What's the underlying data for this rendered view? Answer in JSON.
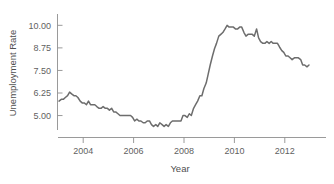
{
  "chart_data": {
    "type": "line",
    "title": "",
    "xlabel": "Year",
    "ylabel": "Unemployment Rate",
    "xlim": [
      2003.0,
      2013.0
    ],
    "ylim": [
      4.2,
      10.35
    ],
    "grid": false,
    "legend": null,
    "x_ticks": [
      2004,
      2006,
      2008,
      2010,
      2012
    ],
    "x_tick_labels": [
      "2004",
      "2006",
      "2008",
      "2010",
      "2012"
    ],
    "y_ticks": [
      5.0,
      6.25,
      7.5,
      8.75,
      10.0
    ],
    "y_tick_labels": [
      "5.00",
      "6.25",
      "7.50",
      "8.75",
      "10.00"
    ],
    "line_color": "#6d6d6d",
    "axis_color": "#8e8e8e",
    "series": [
      {
        "name": "Unemployment Rate",
        "x": [
          2003.04,
          2003.13,
          2003.21,
          2003.29,
          2003.38,
          2003.46,
          2003.54,
          2003.63,
          2003.71,
          2003.79,
          2003.88,
          2003.96,
          2004.04,
          2004.13,
          2004.21,
          2004.29,
          2004.38,
          2004.46,
          2004.54,
          2004.63,
          2004.71,
          2004.79,
          2004.88,
          2004.96,
          2005.04,
          2005.13,
          2005.21,
          2005.29,
          2005.38,
          2005.46,
          2005.54,
          2005.63,
          2005.71,
          2005.79,
          2005.88,
          2005.96,
          2006.04,
          2006.13,
          2006.21,
          2006.29,
          2006.38,
          2006.46,
          2006.54,
          2006.63,
          2006.71,
          2006.79,
          2006.88,
          2006.96,
          2007.04,
          2007.13,
          2007.21,
          2007.29,
          2007.38,
          2007.46,
          2007.54,
          2007.63,
          2007.71,
          2007.79,
          2007.88,
          2007.96,
          2008.04,
          2008.13,
          2008.21,
          2008.29,
          2008.38,
          2008.46,
          2008.54,
          2008.63,
          2008.71,
          2008.79,
          2008.88,
          2008.96,
          2009.04,
          2009.13,
          2009.21,
          2009.29,
          2009.38,
          2009.46,
          2009.54,
          2009.63,
          2009.71,
          2009.79,
          2009.88,
          2009.96,
          2010.04,
          2010.13,
          2010.21,
          2010.29,
          2010.38,
          2010.46,
          2010.54,
          2010.63,
          2010.71,
          2010.79,
          2010.88,
          2010.96,
          2011.04,
          2011.13,
          2011.21,
          2011.29,
          2011.38,
          2011.46,
          2011.54,
          2011.63,
          2011.71,
          2011.79,
          2011.88,
          2011.96,
          2012.04,
          2012.13,
          2012.21,
          2012.29,
          2012.38,
          2012.46,
          2012.54,
          2012.63,
          2012.71,
          2012.79,
          2012.88,
          2012.96
        ],
        "values": [
          5.8,
          5.9,
          5.9,
          6.0,
          6.1,
          6.3,
          6.2,
          6.1,
          6.1,
          6.0,
          5.8,
          5.7,
          5.7,
          5.6,
          5.8,
          5.6,
          5.6,
          5.6,
          5.5,
          5.4,
          5.4,
          5.5,
          5.4,
          5.4,
          5.3,
          5.4,
          5.2,
          5.2,
          5.1,
          5.0,
          5.0,
          5.0,
          5.0,
          5.0,
          5.0,
          4.9,
          4.7,
          4.8,
          4.7,
          4.7,
          4.6,
          4.6,
          4.7,
          4.7,
          4.5,
          4.4,
          4.5,
          4.4,
          4.6,
          4.5,
          4.4,
          4.5,
          4.4,
          4.6,
          4.7,
          4.7,
          4.7,
          4.7,
          4.7,
          5.0,
          5.0,
          4.9,
          5.1,
          5.0,
          5.4,
          5.6,
          5.8,
          6.1,
          6.1,
          6.5,
          6.8,
          7.3,
          7.8,
          8.3,
          8.7,
          9.0,
          9.4,
          9.5,
          9.6,
          9.8,
          10.0,
          9.9,
          9.9,
          9.9,
          9.8,
          9.8,
          9.9,
          9.9,
          9.6,
          9.4,
          9.5,
          9.5,
          9.5,
          9.4,
          9.8,
          9.3,
          9.1,
          9.0,
          9.0,
          9.1,
          9.0,
          9.1,
          9.0,
          9.0,
          9.0,
          8.8,
          8.6,
          8.5,
          8.3,
          8.3,
          8.2,
          8.1,
          8.2,
          8.2,
          8.2,
          8.1,
          7.8,
          7.8,
          7.7,
          7.8
        ]
      }
    ]
  }
}
